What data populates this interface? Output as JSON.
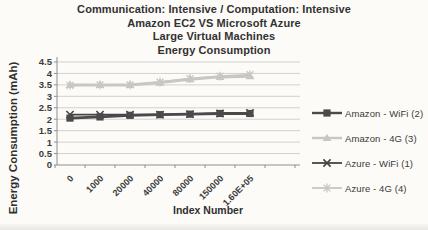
{
  "page": {
    "background": "#fcfbf8"
  },
  "chart_data": {
    "type": "line",
    "title_lines": [
      "Communication: Intensive / Computation: Intensive",
      "Amazon EC2  VS Microsoft Azure",
      "Large Virtual Machines",
      "Energy Consumption"
    ],
    "xlabel": "Index Number",
    "ylabel": "Energy Consumption  (mAh)",
    "categories": [
      "0",
      "1000",
      "20000",
      "40000",
      "80000",
      "150000",
      "1.60E+05"
    ],
    "ylim": [
      0,
      4.5
    ],
    "ytick_step": 0.5,
    "ytick_labels": [
      "0",
      "0.5",
      "1",
      "1.5",
      "2",
      "2.5",
      "3",
      "3.5",
      "4",
      "4.5"
    ],
    "grid": "horizontal",
    "legend_position": "right",
    "series": [
      {
        "name": "Amazon - WiFi (2)",
        "marker": "square",
        "color": "#4a4a4a",
        "line_width": 2.8,
        "values": [
          2.05,
          2.1,
          2.17,
          2.2,
          2.22,
          2.25,
          2.25
        ]
      },
      {
        "name": "Amazon - 4G (3)",
        "marker": "triangle",
        "color": "#c6c8c1",
        "line_width": 3.0,
        "values": [
          3.5,
          3.5,
          3.5,
          3.6,
          3.75,
          3.85,
          3.88
        ]
      },
      {
        "name": "Azure - WiFi (1)",
        "marker": "x",
        "color": "#454545",
        "line_width": 1.8,
        "values": [
          2.2,
          2.2,
          2.2,
          2.2,
          2.22,
          2.25,
          2.28
        ]
      },
      {
        "name": "Azure - 4G (4)",
        "marker": "asterisk",
        "color": "#c7c7c4",
        "line_width": 1.8,
        "values": [
          3.48,
          3.5,
          3.5,
          3.62,
          3.77,
          3.88,
          3.95
        ]
      }
    ],
    "draw_order": [
      3,
      1,
      2,
      0
    ],
    "axis_color": "#8f8f8f",
    "grid_color": "#cccccc",
    "text_color": "#3b3b3b"
  }
}
